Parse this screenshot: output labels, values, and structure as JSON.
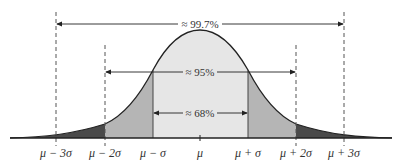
{
  "diagram": {
    "colors": {
      "inner_fill": "#e6e6e6",
      "middle_fill": "#b5b5b5",
      "outer_fill": "#4a4a4a",
      "curve": "#222222",
      "dashed": "#555555"
    },
    "intervals": [
      {
        "name": "within-3-sigma",
        "label": "≈ 99.7%"
      },
      {
        "name": "within-2-sigma",
        "label": "≈ 95%"
      },
      {
        "name": "within-1-sigma",
        "label": "≈ 68%"
      }
    ],
    "axis_labels": [
      "μ − 3σ",
      "μ − 2σ",
      "μ − σ",
      "μ",
      "μ + σ",
      "μ + 2σ",
      "μ + 3σ"
    ]
  }
}
